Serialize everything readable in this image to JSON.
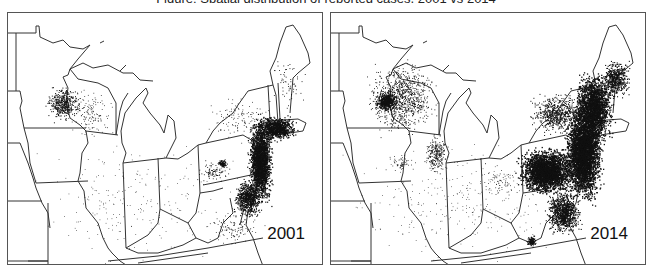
{
  "caption": "Figure: Spatial distribution of reported cases, 2001 vs 2014",
  "colors": {
    "outline": "#333333",
    "dots": "#111111",
    "frame": "#555555",
    "background": "#ffffff"
  },
  "panels": [
    {
      "id": "left",
      "year_label": "2001",
      "seed": 11,
      "clusters": [
        {
          "name": "northeast-corridor-core",
          "cx": 252,
          "cy": 148,
          "rx": 14,
          "ry": 50,
          "n": 2200,
          "size": 1.2
        },
        {
          "name": "new-england-south",
          "cx": 268,
          "cy": 115,
          "rx": 22,
          "ry": 14,
          "n": 900,
          "size": 1.2
        },
        {
          "name": "mid-atlantic-south",
          "cx": 240,
          "cy": 185,
          "rx": 16,
          "ry": 22,
          "n": 700,
          "size": 1.1
        },
        {
          "name": "maine-coast",
          "cx": 280,
          "cy": 70,
          "rx": 20,
          "ry": 30,
          "n": 60,
          "size": 0.9
        },
        {
          "name": "central-pa-cluster",
          "cx": 214,
          "cy": 150,
          "rx": 6,
          "ry": 5,
          "n": 90,
          "size": 1.0
        },
        {
          "name": "pa-scatter",
          "cx": 205,
          "cy": 158,
          "rx": 22,
          "ry": 14,
          "n": 90,
          "size": 0.9
        },
        {
          "name": "upstate-ny-scatter",
          "cx": 230,
          "cy": 105,
          "rx": 38,
          "ry": 28,
          "n": 120,
          "size": 0.8
        },
        {
          "name": "mn-wi-cluster",
          "cx": 55,
          "cy": 90,
          "rx": 20,
          "ry": 20,
          "n": 420,
          "size": 1.0
        },
        {
          "name": "wi-scatter",
          "cx": 80,
          "cy": 100,
          "rx": 30,
          "ry": 30,
          "n": 140,
          "size": 0.8
        },
        {
          "name": "virginia-scatter",
          "cx": 225,
          "cy": 215,
          "rx": 35,
          "ry": 22,
          "n": 120,
          "size": 0.8
        },
        {
          "name": "midwest-background",
          "cx": 130,
          "cy": 190,
          "rx": 125,
          "ry": 70,
          "n": 220,
          "size": 0.7
        }
      ]
    },
    {
      "id": "right",
      "year_label": "2014",
      "seed": 29,
      "clusters": [
        {
          "name": "northeast-corridor-core",
          "cx": 252,
          "cy": 140,
          "rx": 22,
          "ry": 55,
          "n": 3600,
          "size": 1.3
        },
        {
          "name": "pa-ny-mass",
          "cx": 215,
          "cy": 158,
          "rx": 32,
          "ry": 26,
          "n": 2600,
          "size": 1.3
        },
        {
          "name": "new-england-mass",
          "cx": 262,
          "cy": 95,
          "rx": 24,
          "ry": 40,
          "n": 2000,
          "size": 1.3
        },
        {
          "name": "maine-coast",
          "cx": 285,
          "cy": 65,
          "rx": 16,
          "ry": 22,
          "n": 500,
          "size": 1.1
        },
        {
          "name": "upstate-ny",
          "cx": 225,
          "cy": 100,
          "rx": 30,
          "ry": 24,
          "n": 600,
          "size": 1.0
        },
        {
          "name": "virginia-corridor",
          "cx": 232,
          "cy": 200,
          "rx": 20,
          "ry": 25,
          "n": 900,
          "size": 1.1
        },
        {
          "name": "sw-virginia-cluster",
          "cx": 200,
          "cy": 228,
          "rx": 6,
          "ry": 7,
          "n": 120,
          "size": 1.1
        },
        {
          "name": "mn-cluster",
          "cx": 55,
          "cy": 88,
          "rx": 14,
          "ry": 12,
          "n": 500,
          "size": 1.1
        },
        {
          "name": "mn-wi-scatter",
          "cx": 70,
          "cy": 85,
          "rx": 40,
          "ry": 40,
          "n": 900,
          "size": 0.9
        },
        {
          "name": "wi-il-lakeshore",
          "cx": 105,
          "cy": 140,
          "rx": 14,
          "ry": 22,
          "n": 250,
          "size": 0.9
        },
        {
          "name": "iowa-scatter",
          "cx": 70,
          "cy": 150,
          "rx": 18,
          "ry": 10,
          "n": 60,
          "size": 0.8
        },
        {
          "name": "ohio-scatter",
          "cx": 170,
          "cy": 170,
          "rx": 20,
          "ry": 20,
          "n": 70,
          "size": 0.8
        },
        {
          "name": "midwest-background",
          "cx": 130,
          "cy": 190,
          "rx": 125,
          "ry": 70,
          "n": 280,
          "size": 0.7
        }
      ]
    }
  ]
}
